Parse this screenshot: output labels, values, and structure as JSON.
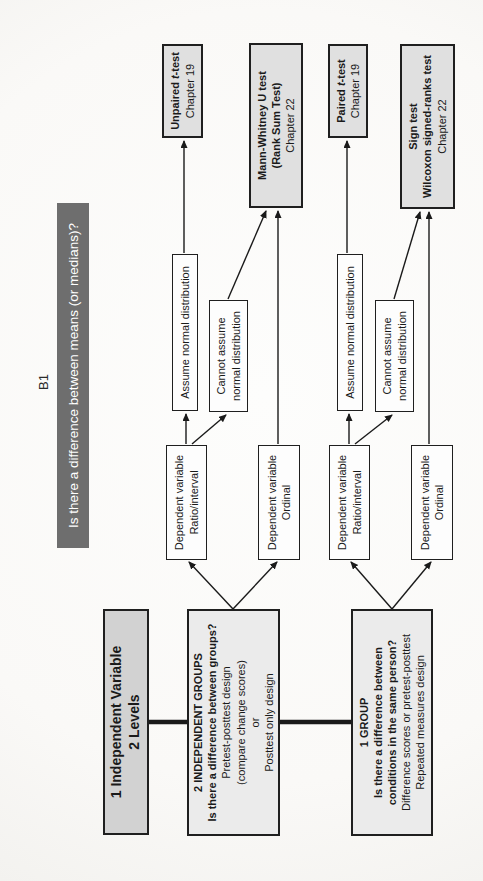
{
  "page_label": "B1",
  "banner": {
    "text": "Is there a difference between means (or medians)?"
  },
  "colors": {
    "banner_bg": "#6e6e6e",
    "banner_fg": "#ffffff",
    "node_gray": "#d2d2d2",
    "node_light_gray": "#ebebeb",
    "test_gray": "#e0e0e0",
    "line_color": "#1a1a1a"
  },
  "nodes": {
    "iv": {
      "lines": [
        "1 Independent Variable",
        "2 Levels"
      ]
    },
    "groups2": {
      "bold_lines": [
        "2 INDEPENDENT GROUPS",
        "Is there a difference between groups?"
      ],
      "lines": [
        "Pretest-posttest design",
        "(compare change scores)",
        "or",
        "Posttest only design"
      ]
    },
    "group1": {
      "bold_lines": [
        "1 GROUP",
        "Is there a difference between",
        "conditions in the same person?"
      ],
      "lines": [
        "Difference scores or pretest-posttest",
        "Repeated measures design"
      ]
    },
    "dv_ratio_a": {
      "lines": [
        "Dependent variable",
        "Ratio/interval"
      ]
    },
    "dv_ordinal_a": {
      "lines": [
        "Dependent variable",
        "Ordinal"
      ]
    },
    "dv_ratio_b": {
      "lines": [
        "Dependent variable",
        "Ratio/interval"
      ]
    },
    "dv_ordinal_b": {
      "lines": [
        "Dependent variable",
        "Ordinal"
      ]
    },
    "assume_a": {
      "lines": [
        "Assume normal distribution"
      ]
    },
    "cannot_a": {
      "lines": [
        "Cannot assume",
        "normal distribution"
      ]
    },
    "assume_b": {
      "lines": [
        "Assume normal distribution"
      ]
    },
    "cannot_b": {
      "lines": [
        "Cannot assume",
        "normal distribution"
      ]
    },
    "unpaired": {
      "title_prefix": "Unpaired ",
      "title_italic": "t",
      "title_suffix": "-test",
      "chapter": "Chapter 19"
    },
    "mannwhitney": {
      "bold_lines": [
        "Mann-Whitney U test",
        "(Rank Sum Test)"
      ],
      "chapter": "Chapter 22"
    },
    "paired": {
      "title_prefix": "Paired ",
      "title_italic": "t",
      "title_suffix": "-test",
      "chapter": "Chapter 19"
    },
    "sign": {
      "bold_lines": [
        "Sign test",
        "Wilcoxon signed-ranks test"
      ],
      "chapter": "Chapter 22"
    }
  }
}
